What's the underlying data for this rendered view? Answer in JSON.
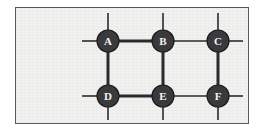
{
  "figure": {
    "background_color": "#ffffff",
    "panel_color": "#f1f1f0",
    "panel_border_color": "#58585a",
    "node_fill_color": "#3a3a3c",
    "node_stroke_color": "#1c1c1e",
    "node_label_color": "#f4f4f4",
    "edge_color": "#2b2b2d",
    "panel": {
      "x": 15,
      "y": 7,
      "width": 234,
      "height": 117
    }
  },
  "graph_data": {
    "type": "node-link-diagram",
    "node_radius": 11,
    "nodes": [
      {
        "id": "A",
        "label": "A",
        "x": 108,
        "y": 41
      },
      {
        "id": "B",
        "label": "B",
        "x": 163,
        "y": 41
      },
      {
        "id": "C",
        "label": "C",
        "x": 218,
        "y": 41
      },
      {
        "id": "D",
        "label": "D",
        "x": 108,
        "y": 96
      },
      {
        "id": "E",
        "label": "E",
        "x": 163,
        "y": 96
      },
      {
        "id": "F",
        "label": "F",
        "x": 218,
        "y": 96
      }
    ],
    "edges": [
      {
        "from": "A",
        "to": "B",
        "weight": "thick",
        "stroke_width": 3
      },
      {
        "from": "B",
        "to": "C",
        "weight": "thin",
        "stroke_width": 1.6
      },
      {
        "from": "D",
        "to": "E",
        "weight": "thick",
        "stroke_width": 3
      },
      {
        "from": "E",
        "to": "F",
        "weight": "thin",
        "stroke_width": 1.6
      },
      {
        "from": "A",
        "to": "D",
        "weight": "thick",
        "stroke_width": 3
      },
      {
        "from": "B",
        "to": "E",
        "weight": "thick",
        "stroke_width": 3
      },
      {
        "from": "C",
        "to": "F",
        "weight": "thick",
        "stroke_width": 3
      }
    ],
    "stubs": [
      {
        "node": "A",
        "direction": "up",
        "x1": 108,
        "y1": 30,
        "x2": 108,
        "y2": 13,
        "stroke_width": 1.6
      },
      {
        "node": "A",
        "direction": "left",
        "x1": 97,
        "y1": 41,
        "x2": 82,
        "y2": 41,
        "stroke_width": 1.6
      },
      {
        "node": "B",
        "direction": "up",
        "x1": 163,
        "y1": 30,
        "x2": 163,
        "y2": 13,
        "stroke_width": 1.6
      },
      {
        "node": "C",
        "direction": "up",
        "x1": 218,
        "y1": 30,
        "x2": 218,
        "y2": 13,
        "stroke_width": 1.6
      },
      {
        "node": "C",
        "direction": "right",
        "x1": 229,
        "y1": 41,
        "x2": 243,
        "y2": 41,
        "stroke_width": 1.6
      },
      {
        "node": "D",
        "direction": "down",
        "x1": 108,
        "y1": 107,
        "x2": 108,
        "y2": 120,
        "stroke_width": 1.6
      },
      {
        "node": "D",
        "direction": "left",
        "x1": 97,
        "y1": 96,
        "x2": 82,
        "y2": 96,
        "stroke_width": 1.6
      },
      {
        "node": "E",
        "direction": "down",
        "x1": 163,
        "y1": 107,
        "x2": 163,
        "y2": 120,
        "stroke_width": 1.6
      },
      {
        "node": "F",
        "direction": "down",
        "x1": 218,
        "y1": 107,
        "x2": 218,
        "y2": 120,
        "stroke_width": 1.6
      },
      {
        "node": "F",
        "direction": "right",
        "x1": 229,
        "y1": 96,
        "x2": 243,
        "y2": 96,
        "stroke_width": 1.6
      }
    ]
  }
}
